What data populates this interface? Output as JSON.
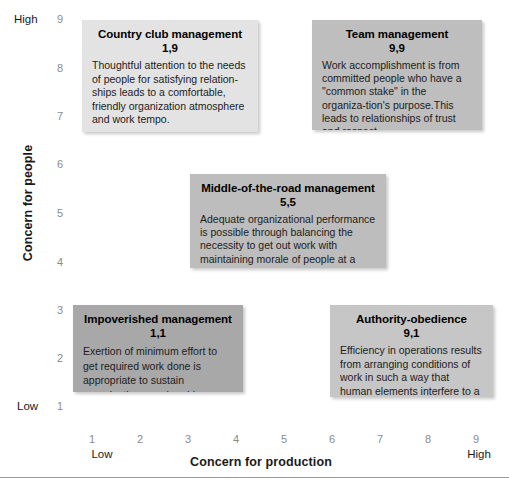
{
  "figure": {
    "name": "managerial-grid",
    "y_axis": {
      "title": "Concern for people",
      "low_label": "Low",
      "high_label": "High",
      "ticks": [
        "9",
        "8",
        "7",
        "6",
        "5",
        "4",
        "3",
        "2",
        "1"
      ],
      "range": [
        1,
        9
      ]
    },
    "x_axis": {
      "title": "Concern for production",
      "low_label": "Low",
      "high_label": "High",
      "ticks": [
        "1",
        "2",
        "3",
        "4",
        "5",
        "6",
        "7",
        "8",
        "9"
      ],
      "range": [
        1,
        9
      ]
    },
    "cells": [
      {
        "id": "country-club",
        "title": "Country club management",
        "coord": "1,9",
        "x": 1,
        "y": 9,
        "body": "Thoughtful attention to the needs of people for satisfying relation-ships leads to a comfortable, friendly organization atmosphere and work tempo.",
        "fill": "#e3e3e3"
      },
      {
        "id": "team",
        "title": "Team management",
        "coord": "9,9",
        "x": 9,
        "y": 9,
        "body": "Work accomplishment is from committed people who have a \"common stake\" in the organiza-tion's purpose.This leads to relationships of trust and respect.",
        "fill": "#bebebe"
      },
      {
        "id": "middle",
        "title": "Middle-of-the-road management",
        "coord": "5,5",
        "x": 5,
        "y": 5,
        "body": "Adequate organizational performance is possible through balancing the necessity to get out work with maintaining morale of people at a satisfactory level.",
        "fill": "#bdbdbd"
      },
      {
        "id": "impoverished",
        "title": "Impoverished management",
        "coord": "1,1",
        "x": 1,
        "y": 1,
        "body": "Exertion of minimum effort to get required work done is appropriate to sustain organization membership.",
        "fill": "#a8a8a8"
      },
      {
        "id": "authority",
        "title": "Authority-obedience",
        "coord": "9,1",
        "x": 9,
        "y": 1,
        "body": "Efficiency in operations results from arranging conditions of work in such a way that human elements interfere to a minimum degree.",
        "fill": "#c6c6c6"
      }
    ]
  }
}
